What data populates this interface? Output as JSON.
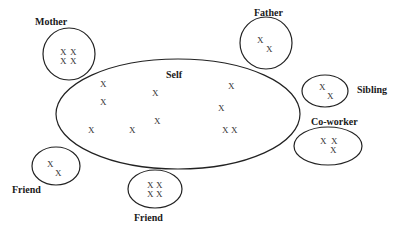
{
  "diagram": {
    "type": "social-network-ego-diagram",
    "center": {
      "label": "Self",
      "marks": [
        "X",
        "X",
        "X",
        "X",
        "X",
        "X",
        "X",
        "X",
        "X",
        "X",
        "X"
      ]
    },
    "groups": [
      {
        "id": "mother",
        "label": "Mother",
        "marks": [
          "X",
          "X",
          "X",
          "X"
        ]
      },
      {
        "id": "father",
        "label": "Father",
        "marks": [
          "X",
          "X"
        ]
      },
      {
        "id": "sibling",
        "label": "Sibling",
        "marks": [
          "X",
          "X"
        ]
      },
      {
        "id": "co-worker",
        "label": "Co-worker",
        "marks": [
          "X",
          "X",
          "X"
        ]
      },
      {
        "id": "friend-left",
        "label": "Friend",
        "marks": [
          "X",
          "X"
        ]
      },
      {
        "id": "friend-bottom",
        "label": "Friend",
        "marks": [
          "X",
          "X",
          "X",
          "X"
        ]
      }
    ]
  }
}
